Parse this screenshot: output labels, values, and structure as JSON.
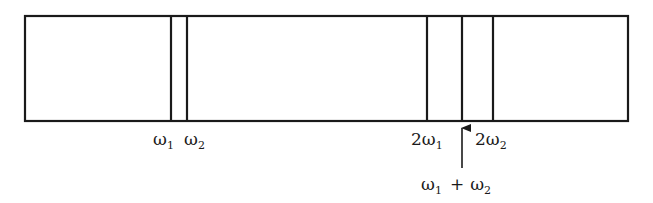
{
  "diagram": {
    "type": "frequency-spectrum-band",
    "box": {
      "x1": 25,
      "y1": 16,
      "x2": 628,
      "y2": 121
    },
    "line_color": "#1a1a1a",
    "lines": [
      {
        "id": "w1",
        "x": 171
      },
      {
        "id": "w2",
        "x": 187
      },
      {
        "id": "2w1",
        "x": 427
      },
      {
        "id": "w1pw2",
        "x": 462
      },
      {
        "id": "2w2",
        "x": 493
      }
    ],
    "labels": {
      "w1": {
        "prefix": "",
        "symbol": "ω",
        "sub": "1"
      },
      "w2": {
        "prefix": "",
        "symbol": "ω",
        "sub": "2"
      },
      "two_w1": {
        "prefix": "2",
        "symbol": "ω",
        "sub": "1"
      },
      "two_w2": {
        "prefix": "2",
        "symbol": "ω",
        "sub": "2"
      },
      "sum": {
        "a_symbol": "ω",
        "a_sub": "1",
        "op": "+",
        "b_symbol": "ω",
        "b_sub": "2"
      }
    },
    "arrow": {
      "x": 462,
      "from_y": 168,
      "to_y": 124,
      "points_to": "w1pw2"
    }
  }
}
